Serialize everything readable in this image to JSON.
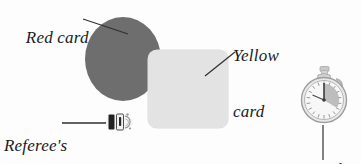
{
  "figure": {
    "background_color": "#fdfdfd"
  },
  "labels": {
    "red_card": "Red card",
    "yellow_card_line1": "Yellow",
    "yellow_card_line2": "card",
    "referees_whistle_line1": "Referee's",
    "referees_whistle_line2": "whistle",
    "stop_watch": "Stop-watch"
  },
  "objects": [
    {
      "name": "red-card",
      "shape": "ellipse",
      "fill": "#6e6e6e",
      "label": "Red card"
    },
    {
      "name": "yellow-card",
      "shape": "rounded-rectangle",
      "fill": "#e3e3e3",
      "label": "Yellow card"
    },
    {
      "name": "referees-whistle",
      "shape": "whistle",
      "fill": "#2b2b2b",
      "label": "Referee's whistle"
    },
    {
      "name": "stop-watch",
      "shape": "stopwatch",
      "fill": "#bdbdbd",
      "label": "Stop-watch"
    }
  ],
  "colors": {
    "ink": "#1a1a1a",
    "leader_line": "#2f2f2f",
    "red_card_gray": "#6e6e6e",
    "yellow_card_gray": "#e3e3e3",
    "stopwatch_gray": "#b5b5b5"
  }
}
